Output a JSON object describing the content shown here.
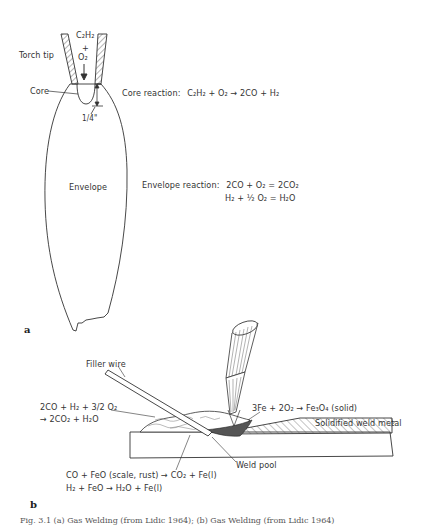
{
  "panel_a": {
    "panel_letter": "a",
    "gas_top": "C₂H₂",
    "gas_plus": "+",
    "gas_bottom": "O₂",
    "torch_tip_label": "Torch tip",
    "core_label": "Core",
    "dimension_label": "1/4\"",
    "envelope_label": "Envelope",
    "core_reaction_title": "Core reaction:",
    "core_reaction_eq": "C₂H₂ + O₂ → 2CO + H₂",
    "envelope_reaction_title": "Envelope reaction:",
    "envelope_reaction_eq1": "2CO + O₂ = 2CO₂",
    "envelope_reaction_eq2": "H₂ + ½ O₂ = H₂O"
  },
  "panel_b": {
    "panel_letter": "b",
    "filler_wire_label": "Filler wire",
    "outer_reaction_line1": "2CO + H₂ + 3/2 O₂",
    "outer_reaction_line2": "→ 2CO₂ + H₂O",
    "oxide_reaction": "3Fe + 2O₂ → Fe₃O₄ (solid)",
    "solidified_label": "Solidified weld metal",
    "weld_pool_label": "Weld pool",
    "reduction_line1": "CO + FeO (scale, rust) → CO₂ + Fe(l)",
    "reduction_line2": "H₂ + FeO → H₂O + Fe(l)"
  },
  "caption": "Fig. 3.1 (a) Gas Welding (from Lidic 1964); (b) Gas Welding (from Lidic 1964)"
}
